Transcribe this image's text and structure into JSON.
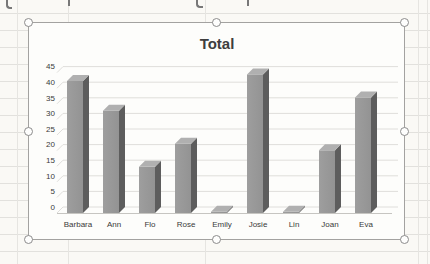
{
  "chart_data": {
    "type": "bar",
    "subtype": "3d-column",
    "title": "Total",
    "categories": [
      "Barbara",
      "Ann",
      "Flo",
      "Rose",
      "Emily",
      "Josie",
      "Lin",
      "Joan",
      "Eva"
    ],
    "values": [
      40,
      31,
      14,
      21,
      0,
      42,
      0,
      19,
      35
    ],
    "series_name": "Total",
    "xlabel": "",
    "ylabel": "",
    "ylim": [
      0,
      45
    ],
    "ytick_step": 5,
    "ytick_labels": [
      "0",
      "5",
      "10",
      "15",
      "20",
      "25",
      "30",
      "35",
      "40",
      "45"
    ],
    "grid": true,
    "legend": "none"
  },
  "colors": {
    "bar_front": "#939393",
    "bar_front_light": "#9e9e9e",
    "bar_side": "#5d5d5d",
    "bar_top": "#b0b0b0",
    "gridline": "#dfdedb",
    "baseline": "#c6c5c1",
    "axis_text": "#3a3a3a",
    "title_text": "#3e3e3e",
    "selection_border": "#a3a2a0",
    "handle_border": "#8c8c8c",
    "handle_fill": "#fefefd",
    "sheet_line": "#e2e1dd",
    "page_bg": "#faf9f5",
    "chart_bg": "#fdfdfb"
  },
  "selection": {
    "state": "chart-selected",
    "handles": [
      "nw",
      "n",
      "ne",
      "w",
      "e",
      "sw",
      "s",
      "se"
    ]
  }
}
